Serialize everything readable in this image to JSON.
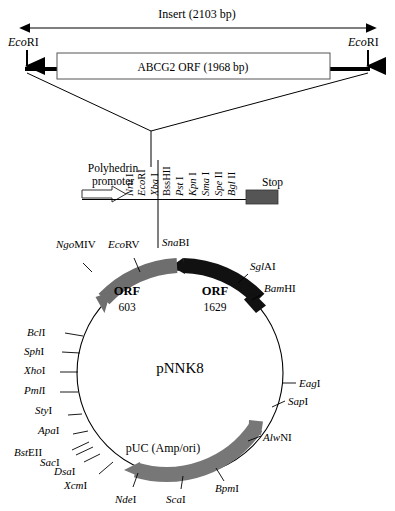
{
  "insert": {
    "label": "Insert (2103 bp)",
    "orf_box_label": "ABCG2 ORF (1968 bp)",
    "left_site": "EcoRI",
    "right_site": "EcoRI",
    "site_italic_prefix": "Eco",
    "site_roman_suffix": "RI"
  },
  "expansion": {
    "promoter_line1": "Polyhedrin",
    "promoter_line2": "promoter",
    "stop_label": "Stop",
    "sites": [
      {
        "italic": "Nru",
        "roman": "I"
      },
      {
        "italic": "Eco",
        "roman": "RI"
      },
      {
        "italic": "Xba",
        "roman": "I"
      },
      {
        "italic": "",
        "roman": "BssHII"
      },
      {
        "italic": "Pst",
        "roman": " I"
      },
      {
        "italic": "Kpn",
        "roman": " I"
      },
      {
        "italic": "Sma",
        "roman": " I"
      },
      {
        "italic": "Spe",
        "roman": " II"
      },
      {
        "italic": "Bgl",
        "roman": " II"
      }
    ]
  },
  "plasmid": {
    "name": "pNNK8",
    "features": [
      {
        "name": "ORF",
        "number": "603",
        "color": "#6e6e6e"
      },
      {
        "name": "ORF",
        "number": "1629",
        "color": "#111111"
      },
      {
        "name": "pUC (Amp/ori)",
        "number": "",
        "color": "#777777"
      }
    ],
    "puc_label": "pUC (Amp/ori)",
    "orf603_name": "ORF",
    "orf603_num": "603",
    "orf1629_name": "ORF",
    "orf1629_num": "1629",
    "sites": [
      {
        "italic": "Ngo",
        "roman": "MIV"
      },
      {
        "italic": "Eco",
        "roman": "RV"
      },
      {
        "italic": "Sna",
        "roman": "BI"
      },
      {
        "italic": "Sgl",
        "roman": "AI"
      },
      {
        "italic": "Bam",
        "roman": "HI"
      },
      {
        "italic": "Eag",
        "roman": "I"
      },
      {
        "italic": "Sap",
        "roman": "I"
      },
      {
        "italic": "Alw",
        "roman": "NI"
      },
      {
        "italic": "Bpm",
        "roman": "I"
      },
      {
        "italic": "Sca",
        "roman": "I"
      },
      {
        "italic": "Nde",
        "roman": "I"
      },
      {
        "italic": "Xcm",
        "roman": "I"
      },
      {
        "italic": "Dsa",
        "roman": "I"
      },
      {
        "italic": "Sac",
        "roman": "I"
      },
      {
        "italic": "Bst",
        "roman": "EII"
      },
      {
        "italic": "Apa",
        "roman": "I"
      },
      {
        "italic": "Sty",
        "roman": "I"
      },
      {
        "italic": "Pml",
        "roman": "I"
      },
      {
        "italic": "Xho",
        "roman": "I"
      },
      {
        "italic": "Sph",
        "roman": "I"
      },
      {
        "italic": "Bcl",
        "roman": "I"
      }
    ]
  },
  "colors": {
    "orf603": "#6e6e6e",
    "orf1629": "#111111",
    "puc": "#777777",
    "stop_box": "#555555",
    "insert_box_fill": "#ffffff",
    "line": "#000000"
  }
}
